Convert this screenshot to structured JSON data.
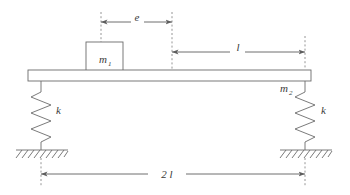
{
  "figure": {
    "type": "mechanical-schematic",
    "background_color": "#ffffff",
    "line_color": "#6b6b6b",
    "text_color": "#3a3a3a"
  },
  "labels": {
    "mass_block": {
      "symbol": "m",
      "subscript": "1",
      "name": "m1"
    },
    "beam_mass": {
      "symbol": "m",
      "subscript": "2",
      "name": "m2"
    },
    "spring_left": {
      "symbol": "k"
    },
    "spring_right": {
      "symbol": "k"
    }
  },
  "dimensions": [
    {
      "id": "e",
      "label": "e",
      "orientation": "horizontal",
      "position": "top",
      "from_x": 101,
      "to_x": 172,
      "y": 22
    },
    {
      "id": "l",
      "label": "l",
      "orientation": "horizontal",
      "position": "upper-right",
      "from_x": 172,
      "to_x": 305,
      "y": 52
    },
    {
      "id": "2l",
      "label": "2 l",
      "label_prefix": "2",
      "label_symbol": "l",
      "orientation": "horizontal",
      "position": "bottom",
      "from_x": 41,
      "to_x": 305,
      "y": 174
    }
  ],
  "components": {
    "beam": {
      "name": "rigid-beam",
      "x": 28,
      "y": 70,
      "width": 283,
      "height": 11
    },
    "block": {
      "name": "mass-block-m1",
      "x": 86,
      "y": 42,
      "width": 37,
      "height": 29
    },
    "spring_left": {
      "name": "spring-left",
      "x": 41,
      "top_y": 81,
      "bottom_y": 150,
      "coils": 4
    },
    "spring_right": {
      "name": "spring-right",
      "x": 305,
      "top_y": 81,
      "bottom_y": 150,
      "coils": 4
    },
    "ground_left": {
      "name": "ground-support-left",
      "x_start": 16,
      "x_end": 68,
      "y": 150
    },
    "ground_right": {
      "name": "ground-support-right",
      "x_start": 280,
      "x_end": 332,
      "y": 150
    }
  }
}
